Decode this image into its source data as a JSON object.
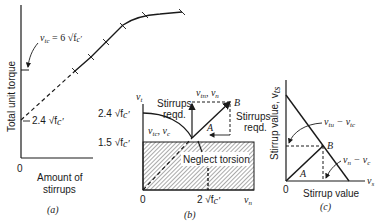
{
  "panels": {
    "a": {
      "caption": "(a)",
      "ylabel": "Total unit torque",
      "xlabel_line1": "Amount of",
      "xlabel_line2": "stirrups",
      "origin": "0",
      "annotation_vtc": "v",
      "annotation_vtc_sub": "tc",
      "annotation_vtc_rest": " = 6 √f",
      "annotation_vtc_prime": "c′",
      "annotation_low": "2.4 √f",
      "annotation_low_prime": "c′"
    },
    "b": {
      "caption": "(b)",
      "yaxis": "v",
      "yaxis_sub": "t",
      "xaxis": "v",
      "xaxis_sub": "n",
      "origin": "0",
      "tick_y_high": "2.4 √f",
      "tick_y_high_prime": "c′",
      "tick_y_low": "1.5 √f",
      "tick_y_low_prime": "c′",
      "tick_x": "2 √f",
      "tick_x_prime": "c′",
      "stirrups_left_1": "Stirrups",
      "stirrups_left_2": "reqd.",
      "stirrups_right_1": "Stirrups",
      "stirrups_right_2": "reqd.",
      "point_a": "A",
      "point_b": "B",
      "label_vtn_vn": "v",
      "label_vtn_sub": "tn",
      "label_vn_rest": ", v",
      "label_vn_sub": "n",
      "label_vtc_vc": "v",
      "label_vtc_sub": "tc",
      "label_vc_rest": ", v",
      "label_vc_sub": "c",
      "neglect": "Neglect torsion"
    },
    "c": {
      "caption": "(c)",
      "ylabel": "Stirrup value, v",
      "ylabel_sub": "ts",
      "xaxis": "v",
      "xaxis_sub": "s",
      "xlabel": "Stirrup value",
      "origin": "0",
      "point_a": "A",
      "point_b": "B",
      "label_upper": "v",
      "label_upper_sub1": "tu",
      "label_upper_mid": " − v",
      "label_upper_sub2": "tc",
      "label_lower": "v",
      "label_lower_sub1": "n",
      "label_lower_mid": " − v",
      "label_lower_sub2": "c"
    }
  }
}
